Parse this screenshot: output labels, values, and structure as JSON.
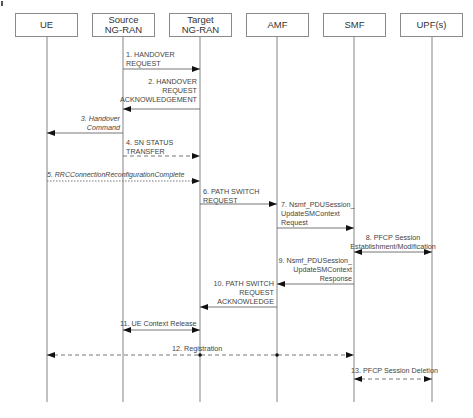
{
  "participants": [
    {
      "id": "ue",
      "label_lines": [
        "UE"
      ]
    },
    {
      "id": "source",
      "label_lines": [
        "Source",
        "NG-RAN"
      ]
    },
    {
      "id": "target",
      "label_lines": [
        "Target",
        "NG-RAN"
      ]
    },
    {
      "id": "amf",
      "label_lines": [
        "AMF"
      ]
    },
    {
      "id": "smf",
      "label_lines": [
        "SMF"
      ]
    },
    {
      "id": "upf",
      "label_lines": [
        "UPF(s)"
      ]
    }
  ],
  "messages": [
    {
      "n": 1,
      "from": "source",
      "to": "target",
      "style": "solid",
      "text": "1. HANDOVER\nREQUEST"
    },
    {
      "n": 2,
      "from": "target",
      "to": "source",
      "style": "solid",
      "text": "2. HANDOVER\nREQUEST\nACKNOWLEDGEMENT"
    },
    {
      "n": 3,
      "from": "source",
      "to": "ue",
      "style": "solid",
      "italic": true,
      "text": "3. Handover\nCommand"
    },
    {
      "n": 4,
      "from": "source",
      "to": "target",
      "style": "dashed",
      "text": "4. SN STATUS\nTRANSFER"
    },
    {
      "n": 5,
      "from": "ue",
      "to": "target",
      "style": "dotted",
      "italic": true,
      "text": "5. RRCConnectionReconfigurationComplete"
    },
    {
      "n": 6,
      "from": "target",
      "to": "amf",
      "style": "solid",
      "text": "6. PATH SWITCH\nREQUEST"
    },
    {
      "n": 7,
      "from": "amf",
      "to": "smf",
      "style": "solid",
      "text": "7. Nsmf_PDUSession_\nUpdateSMContext\nRequest"
    },
    {
      "n": 8,
      "from": "smf",
      "to": "upf",
      "style": "solid",
      "bidirectional": true,
      "text": "8. PFCP Session\nEstablishment/Modification"
    },
    {
      "n": 9,
      "from": "smf",
      "to": "amf",
      "style": "solid",
      "text": "9. Nsmf_PDUSession_\nUpdateSMContext\nResponse"
    },
    {
      "n": 10,
      "from": "amf",
      "to": "target",
      "style": "solid",
      "text": "10. PATH SWITCH\nREQUEST\nACKNOWLEDGE"
    },
    {
      "n": 11,
      "from": "source",
      "to": "target",
      "style": "solid",
      "bidirectional": true,
      "text": "11. UE Context Release"
    },
    {
      "n": 12,
      "from": "ue",
      "to": "smf",
      "style": "dashed",
      "bidirectional": true,
      "via": [
        "target",
        "amf"
      ],
      "text": "12. Registration"
    },
    {
      "n": 13,
      "from": "smf",
      "to": "upf",
      "style": "dashed",
      "bidirectional": true,
      "text": "13. PFCP Session Deletion"
    }
  ],
  "colors": {
    "line": "#777777",
    "arrow": "#111111",
    "text": "#444444"
  }
}
